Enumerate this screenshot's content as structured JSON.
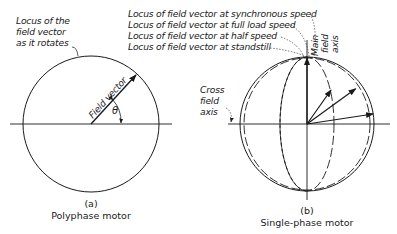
{
  "figure_a": {
    "locus_label_lines": [
      "Locus of the",
      "field vector",
      "as it rotates"
    ],
    "vector_label": "Field vector",
    "angle_label": "θ",
    "caption_letter": "(a)",
    "caption_title": "Polyphase motor"
  },
  "figure_b": {
    "locus_labels": [
      "Locus of field vector at synchronous speed",
      "Locus of field vector at full load speed",
      "Locus of field vector at half speed",
      "Locus of field vector at standstill"
    ],
    "main_axis_lines": [
      "Main",
      "field",
      "axis"
    ],
    "cross_axis_lines": [
      "Cross",
      "field",
      "axis"
    ],
    "caption_letter": "(b)",
    "caption_title": "Single-phase motor"
  },
  "colors": {
    "ink": "#1a1a1a",
    "background": "#ffffff"
  }
}
